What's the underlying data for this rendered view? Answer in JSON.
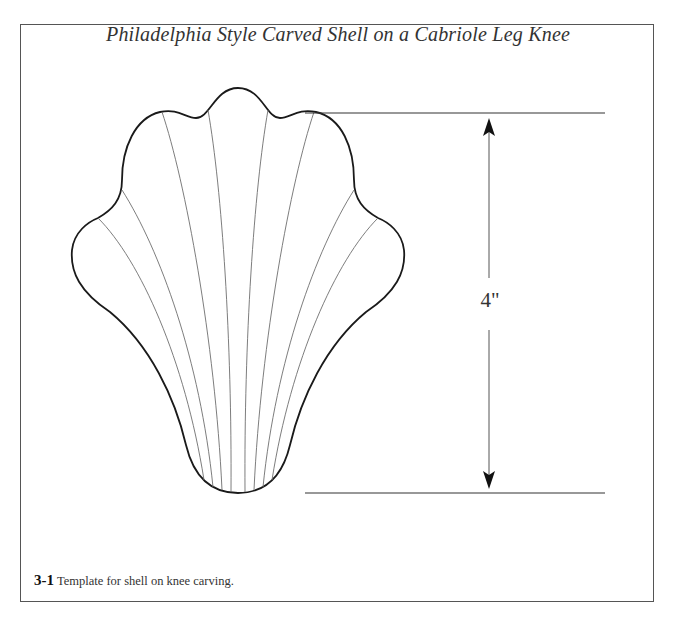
{
  "figure": {
    "title": "Philadelphia Style Carved Shell on a Cabriole Leg Knee",
    "dimension_label": "4\"",
    "caption_number": "3-1",
    "caption_text": "Template for shell on knee carving."
  },
  "colors": {
    "outline": "#1a1a1a",
    "flute_lines": "#6e6e6e",
    "dimension_lines": "#333333",
    "frame": "#555555",
    "text": "#333333"
  }
}
